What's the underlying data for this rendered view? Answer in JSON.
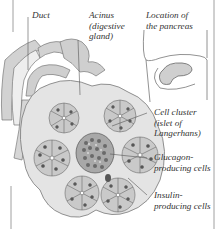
{
  "figure": {
    "colors": {
      "background": "#ffffff",
      "cell_fill": "#c9c9c9",
      "tissue_fill": "#e4e4e4",
      "outline": "#6a6a6a",
      "nucleus": "#555555",
      "islet": "#8a8a8a",
      "label_text": "#333333"
    }
  },
  "labels": {
    "duct": {
      "lines": [
        "Duct"
      ]
    },
    "acinus": {
      "lines": [
        "Acinus",
        "(digestive",
        "gland)"
      ]
    },
    "location": {
      "lines": [
        "Location of",
        "the pancreas"
      ]
    },
    "islet": {
      "lines": [
        "Cell cluster",
        "(islet of",
        "Langerhans)"
      ]
    },
    "glucagon": {
      "lines": [
        "Glucagon-",
        "producing cells"
      ]
    },
    "insulin": {
      "lines": [
        "Insulin-",
        "producing cells"
      ]
    }
  }
}
